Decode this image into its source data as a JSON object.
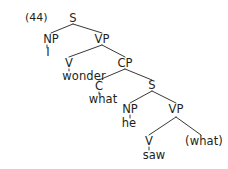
{
  "figure": {
    "example_number": "(44)",
    "caption_text": "",
    "ink_color": "#231f20",
    "background_color": "#ffffff",
    "line_color": "#231f20"
  },
  "tree": {
    "type": "syntax-tree",
    "sentence": "I wonder what he saw",
    "nodes": [
      {
        "id": "S1",
        "label": "S",
        "kind": "category",
        "x": 73,
        "y": 21
      },
      {
        "id": "NP1",
        "label": "NP",
        "kind": "category",
        "x": 51,
        "y": 42
      },
      {
        "id": "I",
        "label": "I",
        "kind": "terminal",
        "x": 47,
        "y": 55
      },
      {
        "id": "VP1",
        "label": "VP",
        "kind": "category",
        "x": 102,
        "y": 42
      },
      {
        "id": "V1",
        "label": "V",
        "kind": "category",
        "x": 69,
        "y": 66
      },
      {
        "id": "wonder",
        "label": "wonder",
        "kind": "terminal",
        "x": 84,
        "y": 79
      },
      {
        "id": "CP",
        "label": "CP",
        "kind": "category",
        "x": 125,
        "y": 66
      },
      {
        "id": "C",
        "label": "C",
        "kind": "category",
        "x": 99,
        "y": 89
      },
      {
        "id": "what",
        "label": "what",
        "kind": "terminal",
        "x": 102,
        "y": 102
      },
      {
        "id": "S2",
        "label": "S",
        "kind": "category",
        "x": 152,
        "y": 88
      },
      {
        "id": "NP2",
        "label": "NP",
        "kind": "category",
        "x": 130,
        "y": 112
      },
      {
        "id": "he",
        "label": "he",
        "kind": "terminal",
        "x": 129,
        "y": 126
      },
      {
        "id": "VP2",
        "label": "VP",
        "kind": "category",
        "x": 176,
        "y": 112
      },
      {
        "id": "V2",
        "label": "V",
        "kind": "category",
        "x": 149,
        "y": 144
      },
      {
        "id": "saw",
        "label": "saw",
        "kind": "terminal",
        "x": 154,
        "y": 158
      },
      {
        "id": "trace",
        "label": "(what)",
        "kind": "trace",
        "x": 204,
        "y": 144
      }
    ],
    "edges": [
      {
        "from": "S1",
        "to": "NP1",
        "x1": 73,
        "y1": 24,
        "x2": 51,
        "y2": 33
      },
      {
        "from": "S1",
        "to": "VP1",
        "x1": 73,
        "y1": 24,
        "x2": 102,
        "y2": 33
      },
      {
        "from": "NP1",
        "to": "I",
        "x1": 47,
        "y1": 45,
        "x2": 47,
        "y2": 47
      },
      {
        "from": "VP1",
        "to": "V1",
        "x1": 102,
        "y1": 45,
        "x2": 69,
        "y2": 57
      },
      {
        "from": "VP1",
        "to": "CP",
        "x1": 102,
        "y1": 45,
        "x2": 125,
        "y2": 57
      },
      {
        "from": "V1",
        "to": "wonder",
        "x1": 69,
        "y1": 69,
        "x2": 69,
        "y2": 71
      },
      {
        "from": "CP",
        "to": "C",
        "x1": 125,
        "y1": 69,
        "x2": 99,
        "y2": 80
      },
      {
        "from": "CP",
        "to": "S2",
        "x1": 125,
        "y1": 69,
        "x2": 152,
        "y2": 80
      },
      {
        "from": "C",
        "to": "what",
        "x1": 99,
        "y1": 92,
        "x2": 99,
        "y2": 94
      },
      {
        "from": "S2",
        "to": "NP2",
        "x1": 152,
        "y1": 91,
        "x2": 130,
        "y2": 103
      },
      {
        "from": "S2",
        "to": "VP2",
        "x1": 152,
        "y1": 91,
        "x2": 176,
        "y2": 103
      },
      {
        "from": "NP2",
        "to": "he",
        "x1": 130,
        "y1": 115,
        "x2": 130,
        "y2": 117
      },
      {
        "from": "VP2",
        "to": "V2",
        "x1": 176,
        "y1": 117,
        "x2": 149,
        "y2": 135
      },
      {
        "from": "VP2",
        "to": "trace",
        "x1": 176,
        "y1": 117,
        "x2": 201,
        "y2": 135
      },
      {
        "from": "V2",
        "to": "saw",
        "x1": 149,
        "y1": 147,
        "x2": 149,
        "y2": 149
      }
    ]
  }
}
